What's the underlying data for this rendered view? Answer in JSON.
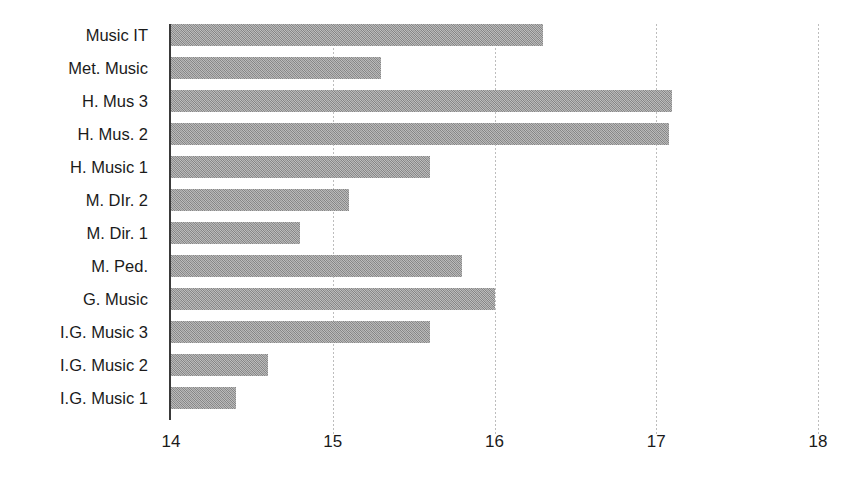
{
  "chart_data": {
    "type": "bar",
    "orientation": "horizontal",
    "title": "",
    "subtitle": "",
    "xlabel": "",
    "ylabel": "",
    "xlim": [
      14,
      18
    ],
    "xticks": [
      "14",
      "15",
      "16",
      "17",
      "18"
    ],
    "grid": "vertical-dotted",
    "legend": "none",
    "bar_color": "#9b9b9b",
    "axis_color": "#3a3a3a",
    "gridline_color": "#bdbdbd",
    "categories": [
      "Music IT",
      "Met. Music",
      "H. Mus 3",
      "H. Mus. 2",
      "H. Music 1",
      "M. DIr. 2",
      "M. Dir. 1",
      "M. Ped.",
      "G. Music",
      "I.G. Music 3",
      "I.G. Music 2",
      "I.G. Music 1"
    ],
    "values": [
      16.3,
      15.3,
      17.1,
      17.08,
      15.6,
      15.1,
      14.8,
      15.8,
      16.0,
      15.6,
      14.6,
      14.4
    ],
    "series": [
      {
        "name": "",
        "values": [
          16.3,
          15.3,
          17.1,
          17.08,
          15.6,
          15.1,
          14.8,
          15.8,
          16.0,
          15.6,
          14.6,
          14.4
        ]
      }
    ]
  }
}
